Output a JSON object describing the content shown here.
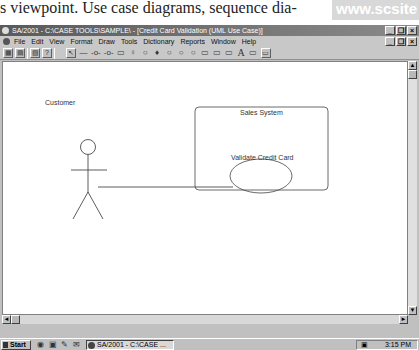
{
  "page": {
    "book_text": "s viewpoint. Use case diagrams, sequence dia-",
    "watermark": "www.scsite"
  },
  "window": {
    "title": "SA/2001 - C:\\CASE TOOLS\\SAMPLE\\ - [Credit Card Validation (UML Use Case)]",
    "controls": {
      "minimize": "_",
      "restore": "❐",
      "close": "×"
    }
  },
  "menubar": {
    "items": [
      "File",
      "Edit",
      "View",
      "Format",
      "Draw",
      "Tools",
      "Dictionary",
      "Reports",
      "Window",
      "Help"
    ]
  },
  "toolbar": {
    "file_icons": [
      "▦",
      "▤",
      "▧",
      "?"
    ],
    "draw_icons": [
      "↖",
      "—",
      "-o-",
      "-o-",
      "▭",
      "♀",
      "○",
      "♦",
      "○",
      "○",
      "○",
      "▭",
      "▭",
      "▭",
      "A",
      "▭",
      "▭"
    ]
  },
  "diagram": {
    "actor": {
      "name": "Customer"
    },
    "system_boundary": {
      "name": "Sales System"
    },
    "use_case": {
      "name": "Validate Credit Card"
    }
  },
  "scrollbars": {
    "up": "▲",
    "down": "▼",
    "left": "◄",
    "right": "►"
  },
  "taskbar": {
    "start_label": "Start",
    "quick_launch": [
      "◉",
      "▣",
      "✎",
      "✉"
    ],
    "task_label": "SA/2001 - C:\\CASE ...",
    "tray_icon": "▣",
    "clock": "3:15 PM"
  }
}
